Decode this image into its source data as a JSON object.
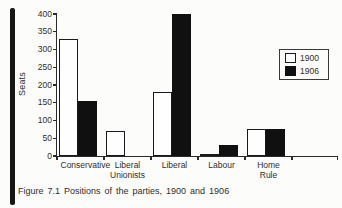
{
  "caption": "Figure 7.1 Positions of the parties, 1900 and 1906",
  "colors": {
    "background": "#fcfcfa",
    "axis": "#2a2a2a",
    "text": "#2e2e2e",
    "spine_band": "#161616",
    "bar_1900_fill": "#fefefe",
    "bar_1906_fill": "#101010",
    "bar_outline": "#1a1a1a"
  },
  "chart_data": {
    "type": "bar",
    "title": "",
    "xlabel": "",
    "ylabel": "Seats",
    "categories": [
      "Conservative",
      "Liberal Unionists",
      "Liberal",
      "Labour",
      "Home Rule"
    ],
    "series": [
      {
        "name": "1900",
        "color": "#fefefe",
        "border": "#1a1a1a",
        "values": [
          330,
          70,
          180,
          5,
          75
        ]
      },
      {
        "name": "1906",
        "color": "#101010",
        "border": "#101010",
        "values": [
          155,
          0,
          400,
          30,
          75
        ]
      }
    ],
    "ylim": [
      0,
      400
    ],
    "yticks": [
      0,
      50,
      100,
      150,
      200,
      250,
      300,
      350,
      400
    ],
    "grid": false,
    "legend_position": "top-right",
    "legend_border": true
  }
}
